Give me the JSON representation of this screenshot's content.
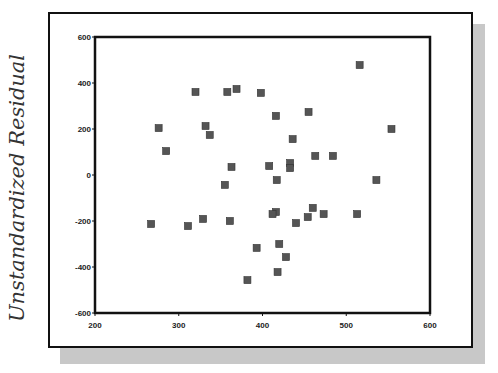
{
  "chart_data": {
    "type": "scatter",
    "title": "",
    "xlabel": "",
    "ylabel": "Unstandardized Residual",
    "xlim": [
      200,
      600
    ],
    "ylim": [
      -600,
      600
    ],
    "x_ticks": [
      200,
      300,
      400,
      500,
      600
    ],
    "y_ticks": [
      600,
      400,
      200,
      0,
      -200,
      -400,
      -600
    ],
    "grid": false,
    "legend": null,
    "marker": "square",
    "marker_color": "#555555",
    "points": [
      {
        "x": 320,
        "y": 361
      },
      {
        "x": 358,
        "y": 361
      },
      {
        "x": 369,
        "y": 374
      },
      {
        "x": 276,
        "y": 204
      },
      {
        "x": 332,
        "y": 213
      },
      {
        "x": 337,
        "y": 174
      },
      {
        "x": 285,
        "y": 104
      },
      {
        "x": 363,
        "y": 35
      },
      {
        "x": 516,
        "y": 478
      },
      {
        "x": 398,
        "y": 357
      },
      {
        "x": 416,
        "y": 257
      },
      {
        "x": 455,
        "y": 274
      },
      {
        "x": 554,
        "y": 200
      },
      {
        "x": 436,
        "y": 156
      },
      {
        "x": 463,
        "y": 83
      },
      {
        "x": 484,
        "y": 83
      },
      {
        "x": 408,
        "y": 39
      },
      {
        "x": 433,
        "y": 52
      },
      {
        "x": 433,
        "y": 30
      },
      {
        "x": 355,
        "y": -43
      },
      {
        "x": 417,
        "y": -22
      },
      {
        "x": 267,
        "y": -213
      },
      {
        "x": 311,
        "y": -222
      },
      {
        "x": 329,
        "y": -191
      },
      {
        "x": 361,
        "y": -200
      },
      {
        "x": 416,
        "y": -161
      },
      {
        "x": 412,
        "y": -170
      },
      {
        "x": 440,
        "y": -209
      },
      {
        "x": 393,
        "y": -317
      },
      {
        "x": 420,
        "y": -300
      },
      {
        "x": 428,
        "y": -357
      },
      {
        "x": 418,
        "y": -422
      },
      {
        "x": 382,
        "y": -457
      },
      {
        "x": 536,
        "y": -22
      },
      {
        "x": 460,
        "y": -143
      },
      {
        "x": 454,
        "y": -183
      },
      {
        "x": 473,
        "y": -170
      },
      {
        "x": 513,
        "y": -170
      }
    ]
  },
  "labels": {
    "ylabel": "Unstandardized Residual",
    "x_ticks": [
      "200",
      "300",
      "400",
      "500",
      "600"
    ],
    "y_ticks": [
      "600",
      "400",
      "200",
      "0",
      "-200",
      "-400",
      "-600"
    ]
  }
}
